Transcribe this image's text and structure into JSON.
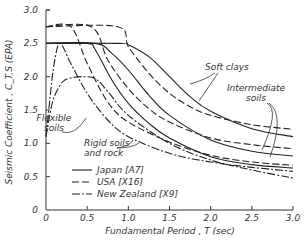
{
  "chart_data": {
    "type": "line",
    "title": "",
    "xlabel": "Fundamental Period , T (sec)",
    "ylabel": "Seismic Coefficient , C_T,S (EPA)",
    "xlim": [
      0,
      3.0
    ],
    "ylim": [
      0,
      3.0
    ],
    "xticks": [
      "0",
      "0.5",
      "1.0",
      "1.5",
      "2.0",
      "2.5",
      "3.0"
    ],
    "yticks": [
      "0",
      "0.5",
      "1.0",
      "1.5",
      "2.0",
      "2.5",
      "3.0"
    ],
    "grid": false,
    "legend": [
      {
        "label": "Japan [A7]",
        "style": "solid"
      },
      {
        "label": "USA [X16]",
        "style": "dashed"
      },
      {
        "label": "New Zealand [X9]",
        "style": "dashdot"
      }
    ],
    "legend_position": "lower-left",
    "annotations": [
      {
        "text": "Soft clays",
        "x": 2.05,
        "y": 2.28
      },
      {
        "text": "Intermediate soils",
        "x": 2.45,
        "y": 1.9
      },
      {
        "text": "Flexible soils",
        "x": 0.05,
        "y": 1.5
      },
      {
        "text": "Rigid soils and rock",
        "x": 1.0,
        "y": 1.05
      }
    ],
    "series": [
      {
        "name": "Japan [A7] - Rigid soils and rock",
        "style": "solid",
        "x": [
          0,
          0.5,
          0.6,
          0.8,
          1.0,
          1.25,
          1.5,
          2.0,
          2.5,
          3.0
        ],
        "y": [
          2.5,
          2.5,
          2.4,
          1.95,
          1.6,
          1.3,
          1.08,
          0.8,
          0.68,
          0.63
        ]
      },
      {
        "name": "Japan [A7] - Intermediate soils",
        "style": "solid",
        "x": [
          0,
          0.6,
          0.8,
          1.0,
          1.25,
          1.5,
          2.0,
          2.5,
          3.0
        ],
        "y": [
          2.5,
          2.5,
          2.35,
          2.1,
          1.72,
          1.42,
          1.05,
          0.88,
          0.81
        ]
      },
      {
        "name": "Japan [A7] - Soft clays",
        "style": "solid",
        "x": [
          0,
          0.9,
          1.0,
          1.25,
          1.5,
          1.75,
          2.0,
          2.5,
          3.0
        ],
        "y": [
          2.5,
          2.5,
          2.48,
          2.3,
          2.0,
          1.7,
          1.48,
          1.22,
          1.1
        ]
      },
      {
        "name": "USA [X16] - Rigid soils and rock",
        "style": "dashed",
        "x": [
          0,
          0.3,
          0.5,
          0.75,
          1.0,
          1.5,
          2.0,
          2.5,
          3.0
        ],
        "y": [
          2.75,
          2.75,
          2.2,
          1.62,
          1.32,
          1.02,
          0.82,
          0.72,
          0.67
        ]
      },
      {
        "name": "USA [X16] - Intermediate soils",
        "style": "dashed",
        "x": [
          0,
          0.55,
          0.75,
          1.0,
          1.25,
          1.5,
          2.0,
          2.5,
          3.0
        ],
        "y": [
          2.75,
          2.75,
          2.25,
          1.82,
          1.52,
          1.32,
          1.08,
          0.98,
          0.92
        ]
      },
      {
        "name": "USA [X16] - Soft clays",
        "style": "dashed",
        "x": [
          0,
          0.87,
          1.0,
          1.25,
          1.5,
          1.75,
          2.0,
          2.5,
          3.0
        ],
        "y": [
          2.75,
          2.75,
          2.45,
          2.05,
          1.75,
          1.55,
          1.42,
          1.28,
          1.21
        ]
      },
      {
        "name": "New Zealand [X9] - Rigid soils",
        "style": "dashdot",
        "x": [
          0,
          0.05,
          0.1,
          0.17,
          0.3,
          0.5,
          0.75,
          1.0,
          1.5,
          2.0,
          2.5,
          3.0
        ],
        "y": [
          1.1,
          1.7,
          2.2,
          2.5,
          2.2,
          1.75,
          1.35,
          1.1,
          0.85,
          0.72,
          0.64,
          0.58
        ]
      },
      {
        "name": "New Zealand [X9] - Flexible soils",
        "style": "dashdot",
        "x": [
          0,
          0.05,
          0.1,
          0.2,
          0.3,
          0.45,
          0.6,
          0.75,
          1.0,
          1.5,
          2.0,
          2.5,
          3.0
        ],
        "y": [
          1.1,
          1.45,
          1.7,
          1.92,
          1.98,
          2.0,
          1.97,
          1.78,
          1.42,
          1.0,
          0.75,
          0.6,
          0.48
        ]
      }
    ]
  }
}
